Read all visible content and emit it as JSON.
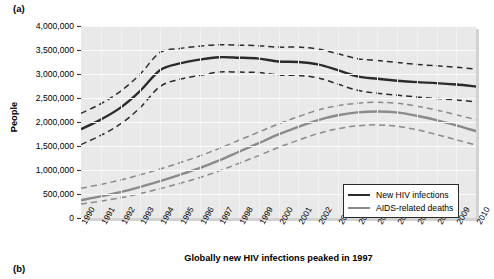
{
  "figure": {
    "panel_a_label": "(a)",
    "panel_b_label": "(b)"
  },
  "legend": {
    "items": [
      {
        "label": "New HIV infections",
        "color": "#2b2b2b"
      },
      {
        "label": "AIDS-related deaths",
        "color": "#8a8a8a"
      }
    ]
  },
  "chart_data": {
    "type": "line",
    "title": "",
    "xlabel": "Globally new HIV infections peaked in 1997",
    "ylabel": "People",
    "xlim": [
      1990,
      2010
    ],
    "ylim": [
      0,
      4000000
    ],
    "grid": true,
    "legend_position": "bottom-right",
    "x": [
      1990,
      1991,
      1992,
      1993,
      1994,
      1995,
      1996,
      1997,
      1998,
      1999,
      2000,
      2001,
      2002,
      2003,
      2004,
      2005,
      2006,
      2007,
      2008,
      2009,
      2010
    ],
    "x_tick_labels": [
      "1990",
      "1991",
      "1992",
      "1993",
      "1994",
      "1995",
      "1996",
      "1997",
      "1998",
      "1999",
      "2000",
      "2001",
      "2002",
      "2003",
      "2004",
      "2005",
      "2006",
      "2007",
      "2008",
      "2009",
      "2010"
    ],
    "y_tick_labels": [
      "0",
      "500,000",
      "1,000,000",
      "1,500,000",
      "2,000,000",
      "2,500,000",
      "3,000,000",
      "3,500,000",
      "4,000,000"
    ],
    "y_ticks": [
      0,
      500000,
      1000000,
      1500000,
      2000000,
      2500000,
      3000000,
      3500000,
      4000000
    ],
    "series": [
      {
        "name": "New HIV infections",
        "color": "#2b2b2b",
        "style": "solid",
        "values": [
          1850000,
          2050000,
          2300000,
          2650000,
          3080000,
          3220000,
          3300000,
          3350000,
          3340000,
          3320000,
          3260000,
          3250000,
          3200000,
          3080000,
          2950000,
          2900000,
          2860000,
          2830000,
          2810000,
          2780000,
          2740000
        ]
      },
      {
        "name": "New HIV infections upper bound",
        "color": "#2b2b2b",
        "style": "dashed",
        "values": [
          2180000,
          2380000,
          2640000,
          3000000,
          3450000,
          3530000,
          3580000,
          3610000,
          3600000,
          3590000,
          3560000,
          3560000,
          3520000,
          3420000,
          3320000,
          3280000,
          3240000,
          3200000,
          3170000,
          3140000,
          3100000
        ]
      },
      {
        "name": "New HIV infections lower bound",
        "color": "#2b2b2b",
        "style": "dashed",
        "values": [
          1530000,
          1720000,
          1960000,
          2300000,
          2740000,
          2890000,
          2970000,
          3040000,
          3040000,
          3030000,
          2980000,
          2970000,
          2920000,
          2790000,
          2660000,
          2600000,
          2560000,
          2520000,
          2490000,
          2460000,
          2420000
        ]
      },
      {
        "name": "AIDS-related deaths",
        "color": "#8a8a8a",
        "style": "solid",
        "values": [
          370000,
          450000,
          540000,
          650000,
          770000,
          900000,
          1040000,
          1200000,
          1380000,
          1560000,
          1740000,
          1900000,
          2040000,
          2140000,
          2200000,
          2220000,
          2200000,
          2130000,
          2040000,
          1930000,
          1810000
        ]
      },
      {
        "name": "AIDS-related deaths upper bound",
        "color": "#8a8a8a",
        "style": "dashed",
        "values": [
          620000,
          700000,
          790000,
          900000,
          1020000,
          1150000,
          1290000,
          1450000,
          1620000,
          1790000,
          1960000,
          2110000,
          2250000,
          2340000,
          2390000,
          2410000,
          2390000,
          2330000,
          2250000,
          2150000,
          2050000
        ]
      },
      {
        "name": "AIDS-related deaths lower bound",
        "color": "#8a8a8a",
        "style": "dashed",
        "values": [
          290000,
          350000,
          420000,
          510000,
          610000,
          720000,
          840000,
          980000,
          1140000,
          1300000,
          1470000,
          1620000,
          1760000,
          1860000,
          1920000,
          1940000,
          1910000,
          1840000,
          1740000,
          1630000,
          1520000
        ]
      }
    ]
  }
}
